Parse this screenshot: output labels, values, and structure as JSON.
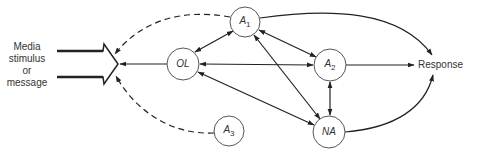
{
  "diagram": {
    "input_label": [
      "Media",
      "stimulus",
      "or",
      "message"
    ],
    "output_label": "Response",
    "nodes": {
      "A1": {
        "name": "A",
        "sub": "1"
      },
      "OL": {
        "name": "OL",
        "sub": ""
      },
      "A2": {
        "name": "A",
        "sub": "2"
      },
      "NA": {
        "name": "NA",
        "sub": ""
      },
      "A3": {
        "name": "A",
        "sub": "3"
      }
    },
    "edges": [
      {
        "from": "A1",
        "to": "Media stimulus",
        "style": "dashed"
      },
      {
        "from": "A3",
        "to": "Media stimulus",
        "style": "dashed"
      },
      {
        "from": "OL",
        "to": "Media stimulus",
        "style": "solid"
      },
      {
        "from": "A1",
        "to": "OL",
        "style": "solid",
        "bidirectional": true
      },
      {
        "from": "A1",
        "to": "A2",
        "style": "solid",
        "bidirectional": true
      },
      {
        "from": "A1",
        "to": "NA",
        "style": "solid",
        "bidirectional": true
      },
      {
        "from": "OL",
        "to": "A2",
        "style": "solid",
        "bidirectional": true
      },
      {
        "from": "OL",
        "to": "NA",
        "style": "solid",
        "bidirectional": true
      },
      {
        "from": "A2",
        "to": "NA",
        "style": "solid",
        "bidirectional": true
      },
      {
        "from": "A1",
        "to": "Response",
        "style": "solid"
      },
      {
        "from": "A2",
        "to": "Response",
        "style": "solid"
      },
      {
        "from": "NA",
        "to": "Response",
        "style": "solid"
      }
    ]
  }
}
